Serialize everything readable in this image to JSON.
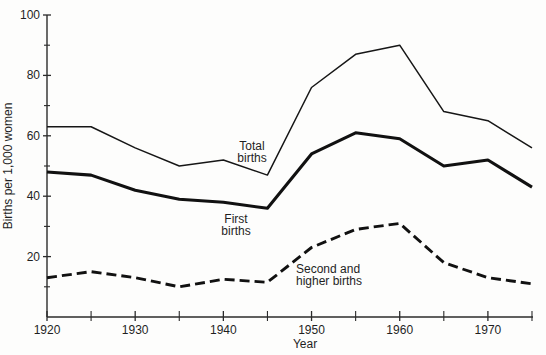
{
  "colors": {
    "line": "#111111",
    "text": "#1f1f1f",
    "background": "#fdfdfc"
  },
  "chart_data": {
    "type": "line",
    "title": "",
    "xlabel": "Year",
    "ylabel": "Births per 1,000 women",
    "x": [
      1920,
      1925,
      1930,
      1935,
      1940,
      1945,
      1950,
      1955,
      1960,
      1965,
      1970,
      1975
    ],
    "xlim": [
      1920,
      1975
    ],
    "ylim": [
      0,
      100
    ],
    "x_major_ticks": [
      1920,
      1930,
      1940,
      1950,
      1960,
      1970
    ],
    "x_minor_ticks": [
      1925,
      1935,
      1945,
      1955,
      1965,
      1975
    ],
    "x_tick_labels": [
      "1920",
      "1930",
      "1940",
      "1950",
      "1960",
      "1970"
    ],
    "y_major_ticks": [
      20,
      40,
      60,
      80,
      100
    ],
    "y_minor_ticks": [
      10,
      30,
      50,
      70,
      90
    ],
    "y_tick_labels": [
      "20",
      "40",
      "60",
      "80",
      "100"
    ],
    "grid": false,
    "legend": "inline-annotations",
    "series": [
      {
        "name": "Total births",
        "style": "thin-solid",
        "values": [
          63,
          63,
          56,
          50,
          52,
          47,
          76,
          87,
          90,
          68,
          65,
          56
        ]
      },
      {
        "name": "First births",
        "style": "thick-solid",
        "values": [
          48,
          47,
          42,
          39,
          38,
          36,
          54,
          61,
          59,
          50,
          52,
          43
        ]
      },
      {
        "name": "Second and higher births",
        "style": "thick-dashed",
        "values": [
          13,
          15,
          13,
          10,
          12.5,
          11.5,
          23,
          29,
          31,
          18,
          13,
          11
        ]
      }
    ],
    "annotations": [
      {
        "name": "total-births-label",
        "lines": [
          "Total",
          "births"
        ],
        "x": 252,
        "y": 150,
        "anchor": "middle"
      },
      {
        "name": "first-births-label",
        "lines": [
          "First",
          "births"
        ],
        "x": 236,
        "y": 223,
        "anchor": "middle"
      },
      {
        "name": "second-and-higher-births-label",
        "lines": [
          "Second and",
          "higher births"
        ],
        "x": 296,
        "y": 273,
        "anchor": "start"
      }
    ]
  },
  "layout": {
    "width": 546,
    "height": 355,
    "x0_px": 47,
    "y0_px": 317,
    "px_per_year": 8.818,
    "px_per_unit": 3.02,
    "axis_right_px": 533,
    "line_height_px": 11.5
  }
}
